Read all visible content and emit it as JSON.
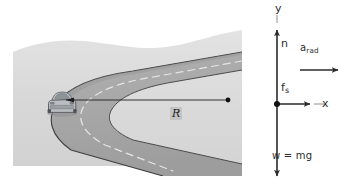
{
  "figure": {
    "illustration": {
      "name": "banked-road-curve-illustration",
      "alt_text": "Perspective drawing of a two-lane road curving back on itself with a silver car travelling around the inside of the curve",
      "vehicle_label": "car",
      "center_dot_label": "curve-center",
      "radius_label": "R"
    },
    "free_body_diagram": {
      "axis_y_label": "y",
      "axis_x_label": "x",
      "normal_force_label": "n",
      "friction_force_label": "f",
      "friction_force_subscript": "s",
      "radial_acceleration_label": "a",
      "radial_acceleration_subscript": "rad",
      "weight_label": "w = mg"
    },
    "colors": {
      "road_surface": "#a9a9a9",
      "ground": "#dcdcdc",
      "ground_shade": "#cfcfcf",
      "sky": "#ffffff",
      "line_dark": "#3c3c3c",
      "center_line": "#e8e8e8",
      "car_body": "#b9bcc0",
      "arrow": "#2b2b2b",
      "text": "#2b2b2b"
    }
  }
}
